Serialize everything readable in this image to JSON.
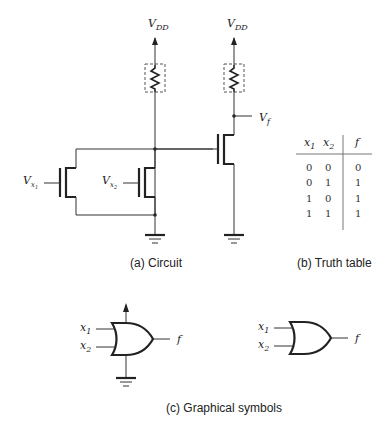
{
  "circuit": {
    "supply_label_main": "V",
    "supply_label_sub": "DD",
    "input1_label": "V",
    "input1_sub": "x",
    "input1_subsub": "1",
    "input2_label": "V",
    "input2_sub": "x",
    "input2_subsub": "2",
    "output_label": "V",
    "output_sub": "f",
    "caption": "(a) Circuit"
  },
  "truth_table": {
    "headers": [
      "x1",
      "x2",
      "f"
    ],
    "header_x1_base": "x",
    "header_x1_sub": "1",
    "header_x2_base": "x",
    "header_x2_sub": "2",
    "header_f": "f",
    "rows": [
      [
        "0",
        "0",
        "0"
      ],
      [
        "0",
        "1",
        "1"
      ],
      [
        "1",
        "0",
        "1"
      ],
      [
        "1",
        "1",
        "1"
      ]
    ],
    "caption": "(b) Truth table"
  },
  "symbols": {
    "in1_base": "x",
    "in1_sub": "1",
    "in2_base": "x",
    "in2_sub": "2",
    "out": "f",
    "caption": "(c) Graphical symbols"
  }
}
